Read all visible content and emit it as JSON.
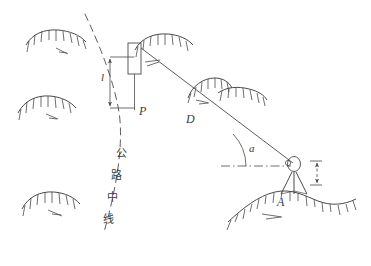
{
  "figure": {
    "stroke_color": "#4a4a4a",
    "background_color": "#ffffff"
  },
  "labels": {
    "offset_length": "l",
    "point_p": "P",
    "slope_distance": "D",
    "vertical_angle": "a",
    "station_a": "A",
    "centerline_char_1": "公",
    "centerline_char_2": "路",
    "centerline_char_3": "中",
    "centerline_char_4": "线",
    "centerline_full": "公路中线"
  },
  "elements": {
    "dashed_curve": "highway-centerline-curve",
    "sight_line": "sight-line-D",
    "horizontal_datum": "horizontal-dash-dot-line",
    "angle_arc": "vertical-angle-arc",
    "target_box": "target-staff-box",
    "offset_dimension": "offset-dimension-line",
    "instrument": "theodolite-instrument",
    "tripod": "tripod-legs",
    "instrument_height_dimension": "instrument-height-dimension",
    "ground_profile": "ground-slope-profile"
  },
  "terrain_symbols": [
    {
      "name": "slope-hatch-top-left",
      "x": 28,
      "y": 36
    },
    {
      "name": "slope-hatch-mid-left",
      "x": 20,
      "y": 100
    },
    {
      "name": "slope-hatch-bottom-left",
      "x": 24,
      "y": 195
    },
    {
      "name": "slope-hatch-top-mid",
      "x": 140,
      "y": 40
    },
    {
      "name": "slope-hatch-center",
      "x": 196,
      "y": 82
    },
    {
      "name": "slope-hatch-center-right",
      "x": 228,
      "y": 95
    }
  ]
}
